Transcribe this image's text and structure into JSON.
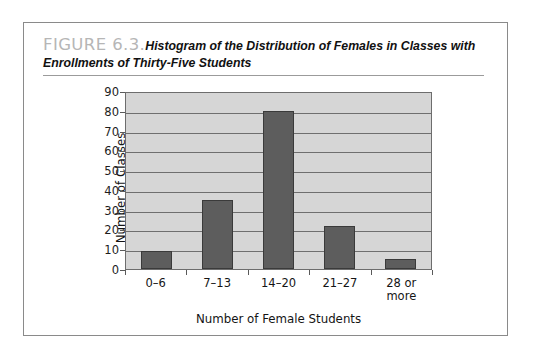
{
  "figure": {
    "label": "FIGURE 6.3.",
    "caption_line1": "Histogram of the Distribution of Females in Classes with",
    "caption_line2": "Enrollments of Thirty-Five Students"
  },
  "colors": {
    "bar_fill": "#5d5d5d",
    "bar_stroke": "#3a3a3a",
    "plot_background": "#d6d6d6",
    "gridline": "#6f6f6f",
    "axis": "#6d6d6d",
    "figure_label": "#b6b6b6",
    "card_border": "#8a8a8a"
  },
  "chart_data": {
    "type": "bar",
    "title": "Histogram of the Distribution of Females in Classes with Enrollments of Thirty-Five Students",
    "subtitle": "",
    "categories": [
      "0–6",
      "7–13",
      "14–20",
      "21–27",
      "28 or more"
    ],
    "category_lines": [
      [
        "0–6"
      ],
      [
        "7–13"
      ],
      [
        "14–20"
      ],
      [
        "21–27"
      ],
      [
        "28 or",
        "more"
      ]
    ],
    "values": [
      9,
      35,
      80,
      22,
      5
    ],
    "xlabel": "Number of Female Students",
    "ylabel": "Number of Classes",
    "ylim": [
      0,
      90
    ],
    "ytick_values": [
      0,
      10,
      20,
      30,
      40,
      50,
      60,
      70,
      80,
      90
    ],
    "ytick_labels": [
      "0",
      "10",
      "20",
      "30",
      "40",
      "50",
      "60",
      "70",
      "80",
      "90"
    ],
    "grid": true,
    "grid_axis": "y",
    "legend": false,
    "legend_position": "none"
  }
}
